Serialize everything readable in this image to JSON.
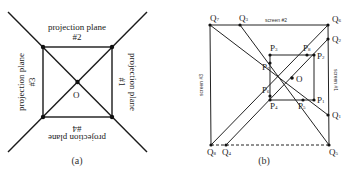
{
  "panel_a": {
    "caption": "(a)",
    "center_label": "O",
    "planes": [
      {
        "id": "top",
        "line1": "projection plane",
        "line2": "#2"
      },
      {
        "id": "left",
        "line1": "projection plane",
        "line2": "#3"
      },
      {
        "id": "right",
        "line1": "projection plane",
        "line2": "#1"
      },
      {
        "id": "bottom",
        "line1": "projection plane",
        "line2": "#4"
      }
    ]
  },
  "panel_b": {
    "caption": "(b)",
    "center_label": "O",
    "screens": {
      "top": "screen #2",
      "left": "screen #3",
      "right": "screen #1"
    },
    "q_labels": {
      "q1": "1",
      "q2": "2",
      "q3": "3",
      "q4": "4",
      "q5": "5",
      "q6": "6",
      "q7": "7",
      "q8": "8"
    },
    "p_labels": {
      "p1": "1",
      "p2": "2",
      "p3": "3",
      "p4": "4",
      "p5": "5",
      "p6": "6",
      "p7": "7",
      "p8": "8"
    },
    "q_letter": "Q",
    "p_letter": "P"
  }
}
